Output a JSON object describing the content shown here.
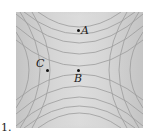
{
  "figure": {
    "number_label": "1."
  },
  "points": [
    {
      "id": "A",
      "label": "A",
      "x": 78,
      "y": 30
    },
    {
      "id": "B",
      "label": "B",
      "x": 78,
      "y": 70
    },
    {
      "id": "C",
      "label": "C",
      "x": 47,
      "y": 70
    }
  ],
  "colors": {
    "background": "#ffffff",
    "plot_light": "#d2d2d2",
    "plot_dark": "#555555",
    "contour": "#9a9a9a",
    "text": "#222222"
  }
}
